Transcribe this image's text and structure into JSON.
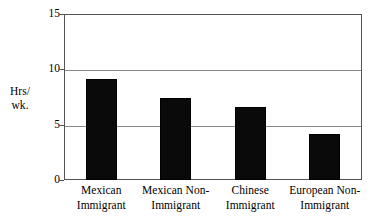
{
  "chart_data": {
    "type": "bar",
    "title": "",
    "xlabel": "",
    "ylabel": "Hrs/ wk.",
    "ylabel_lines": [
      "Hrs/",
      "wk."
    ],
    "categories": [
      "Mexican Immigrant",
      "Mexican Non-Immigrant",
      "Chinese Immigrant",
      "European Non-Immigrant"
    ],
    "category_lines": [
      [
        "Mexican",
        "Immigrant"
      ],
      [
        "Mexican Non-",
        "Immigrant"
      ],
      [
        "Chinese",
        "Immigrant"
      ],
      [
        "European Non-",
        "Immigrant"
      ]
    ],
    "values": [
      9.1,
      7.4,
      6.6,
      4.2
    ],
    "ylim": [
      0,
      15
    ],
    "yticks": [
      0,
      5,
      10,
      15
    ],
    "ytick_labels": [
      "0",
      "5",
      "10",
      "15"
    ],
    "grid": true,
    "grid_axis": "y",
    "legend": "none",
    "bar_color": "#0a0a0a",
    "grid_color": "#8a8a8a",
    "axis_color": "#545454",
    "background_color": "#ffffff"
  }
}
